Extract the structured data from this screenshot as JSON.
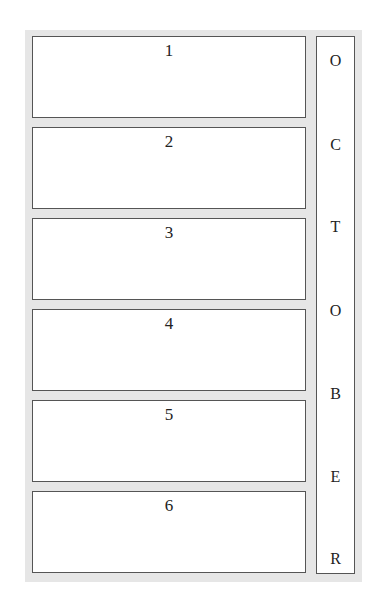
{
  "boxes": [
    {
      "label": "1"
    },
    {
      "label": "2"
    },
    {
      "label": "3"
    },
    {
      "label": "4"
    },
    {
      "label": "5"
    },
    {
      "label": "6"
    }
  ],
  "side_column": {
    "letters": [
      "O",
      "C",
      "T",
      "O",
      "B",
      "E",
      "R"
    ]
  }
}
